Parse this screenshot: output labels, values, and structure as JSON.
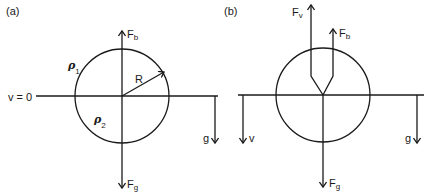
{
  "panels": {
    "a": {
      "label": "(a)",
      "baseline_label": "v = 0",
      "force_up": {
        "name": "F",
        "sub": "b"
      },
      "force_down": {
        "name": "F",
        "sub": "g"
      },
      "radius_label": "R",
      "density_upper": {
        "symbol": "ρ",
        "sub": "1"
      },
      "density_lower": {
        "symbol": "ρ",
        "sub": "2"
      },
      "gravity_label": "g"
    },
    "b": {
      "label": "(b)",
      "force_viscous": {
        "name": "F",
        "sub": "v"
      },
      "force_up": {
        "name": "F",
        "sub": "b"
      },
      "force_down": {
        "name": "F",
        "sub": "g"
      },
      "velocity_label": "v",
      "gravity_label": "g"
    }
  }
}
